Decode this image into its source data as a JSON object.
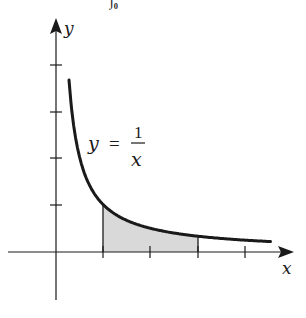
{
  "figure": {
    "top_fragment": "∫₀",
    "equation": {
      "lhs": "y",
      "eq": "=",
      "numerator": "1",
      "denominator": "x"
    },
    "x_axis_label": "x",
    "y_axis_label": "y",
    "colors": {
      "ink": "#1a1a1a",
      "shade": "#d9d9d9",
      "background": "#ffffff"
    }
  },
  "chart_data": {
    "type": "line",
    "title": "",
    "function": "y = 1/x",
    "xlabel": "x",
    "ylabel": "y",
    "x_ticks": [
      1,
      2,
      3,
      4
    ],
    "y_ticks": [
      1,
      2,
      3,
      4
    ],
    "tick_labels_shown": false,
    "xlim": [
      -1,
      4.8
    ],
    "ylim": [
      -1.4,
      4.7
    ],
    "grid": false,
    "shaded_region": {
      "from_x": 1,
      "to_x": 3,
      "under": "y = 1/x",
      "fill": "#d9d9d9"
    },
    "series": [
      {
        "name": "y = 1/x",
        "x": [
          0.28,
          0.5,
          0.75,
          1,
          1.5,
          2,
          2.5,
          3,
          3.5,
          4,
          4.5
        ],
        "values": [
          3.57,
          2,
          1.33,
          1,
          0.67,
          0.5,
          0.4,
          0.33,
          0.29,
          0.25,
          0.22
        ]
      }
    ]
  }
}
